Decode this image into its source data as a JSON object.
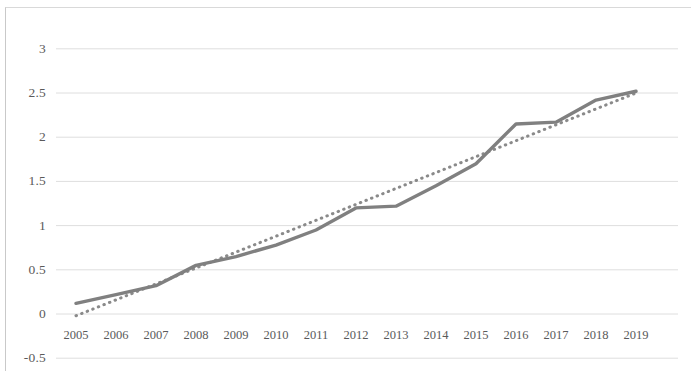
{
  "chart_data": {
    "type": "line",
    "title": "",
    "xlabel": "",
    "ylabel": "",
    "grid": true,
    "legend_position": "none",
    "categories": [
      "2005",
      "2006",
      "2007",
      "2008",
      "2009",
      "2010",
      "2011",
      "2012",
      "2013",
      "2014",
      "2015",
      "2016",
      "2017",
      "2018",
      "2019"
    ],
    "x": [
      2005,
      2006,
      2007,
      2008,
      2009,
      2010,
      2011,
      2012,
      2013,
      2014,
      2015,
      2016,
      2017,
      2018,
      2019
    ],
    "ylim": [
      -0.5,
      3
    ],
    "yticks": [
      3,
      2.5,
      2,
      1.5,
      1,
      0.5,
      0,
      -0.5
    ],
    "ytick_labels": [
      "3",
      "2.5",
      "2",
      "1.5",
      "1",
      "0.5",
      "0",
      "-0.5"
    ],
    "xtick_labels": [
      "2005",
      "2006",
      "2007",
      "2008",
      "2009",
      "2010",
      "2011",
      "2012",
      "2013",
      "2014",
      "2015",
      "2016",
      "2017",
      "2018",
      "2019"
    ],
    "series": [
      {
        "name": "data-series",
        "style": "solid",
        "color": "#808080",
        "values": [
          0.12,
          0.22,
          0.32,
          0.55,
          0.65,
          0.78,
          0.95,
          1.2,
          1.22,
          1.45,
          1.7,
          2.15,
          2.17,
          2.42,
          2.52
        ]
      },
      {
        "name": "linear-trendline",
        "style": "dotted",
        "color": "#8a8a8a",
        "values": [
          -0.02,
          0.16,
          0.34,
          0.52,
          0.7,
          0.88,
          1.06,
          1.24,
          1.42,
          1.6,
          1.78,
          1.96,
          2.14,
          2.32,
          2.5
        ]
      }
    ]
  },
  "colors": {
    "series_line": "#808080",
    "trendline": "#8a8a8a",
    "gridline": "#dedede",
    "axis_border": "#c9c9c9",
    "tick_text": "#5a5a5a",
    "background": "#ffffff"
  },
  "geometry": {
    "plot_left": 56,
    "plot_right": 678,
    "x_first": 76,
    "x_step": 40,
    "y_zero": 314,
    "y_unit_px": 88.4
  }
}
